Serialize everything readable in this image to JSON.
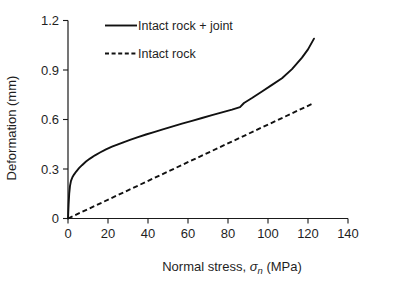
{
  "chart_data": {
    "type": "line",
    "title": "",
    "xlabel": "Normal stress, σn (MPa)",
    "xlabel_prefix": "Normal stress, ",
    "xlabel_symbol": "σ",
    "xlabel_subscript": "n",
    "xlabel_suffix": " (MPa)",
    "ylabel": "Deformation (mm)",
    "xlim": [
      0,
      140
    ],
    "ylim": [
      0,
      1.2
    ],
    "xticks": [
      0,
      20,
      40,
      60,
      80,
      100,
      120,
      140
    ],
    "xtick_labels": [
      "0",
      "20",
      "40",
      "60",
      "80",
      "100",
      "120",
      "140"
    ],
    "yticks": [
      0,
      0.3,
      0.6,
      0.9,
      1.2
    ],
    "ytick_labels": [
      "0",
      "0.3",
      "0.6",
      "0.9",
      "1.2"
    ],
    "grid": false,
    "legend_position": "top-center",
    "line_color": "#111111",
    "axis_color": "#1a1a1a",
    "series": [
      {
        "name": "Intact rock + joint",
        "style": "solid",
        "x": [
          0,
          0.3,
          0.6,
          1.0,
          1.5,
          2.2,
          3.0,
          4.0,
          5.5,
          7.0,
          9.0,
          11.0,
          13.5,
          16.0,
          19.0,
          22.0,
          25.0,
          28.0,
          31.0,
          35.0,
          39.0,
          43.0,
          47.0,
          52.0,
          57.0,
          62.0,
          67.0,
          72.0,
          77.0,
          82.0,
          86.0,
          88.0,
          92.0,
          97.0,
          102.0,
          107.0,
          112.0,
          117.0,
          120.0,
          123.0
        ],
        "y": [
          0,
          0.085,
          0.15,
          0.198,
          0.228,
          0.25,
          0.266,
          0.283,
          0.305,
          0.323,
          0.345,
          0.363,
          0.383,
          0.4,
          0.419,
          0.435,
          0.449,
          0.463,
          0.476,
          0.493,
          0.509,
          0.524,
          0.539,
          0.557,
          0.575,
          0.592,
          0.609,
          0.626,
          0.643,
          0.66,
          0.675,
          0.7,
          0.73,
          0.77,
          0.81,
          0.85,
          0.905,
          0.975,
          1.025,
          1.09
        ]
      },
      {
        "name": "Intact rock",
        "style": "dashed",
        "x": [
          0,
          123
        ],
        "y": [
          0,
          0.7
        ]
      }
    ]
  },
  "legend": {
    "entries": [
      {
        "label": "Intact rock + joint",
        "style": "solid"
      },
      {
        "label": "Intact rock",
        "style": "dashed"
      }
    ]
  }
}
